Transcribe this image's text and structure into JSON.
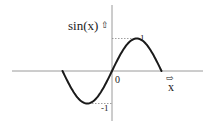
{
  "diagram": {
    "type": "function-plot",
    "function": "sin(x)",
    "labels": {
      "y_axis": "sin(x)",
      "x_axis": "x",
      "origin": "0",
      "max": "1",
      "min": "-1",
      "up_arrow": "⇧",
      "right_arrow": "⇨"
    },
    "colors": {
      "curve": "#1a1a1a",
      "axis": "#999999",
      "guide": "#888888",
      "background": "#ffffff"
    }
  },
  "chart_data": {
    "type": "line",
    "title": "",
    "xlabel": "x",
    "ylabel": "sin(x)",
    "x": [
      -3.1416,
      -2.3562,
      -1.5708,
      -0.7854,
      0,
      0.7854,
      1.5708,
      2.3562,
      3.1416
    ],
    "series": [
      {
        "name": "sin(x)",
        "values": [
          0,
          -0.707,
          -1,
          -0.707,
          0,
          0.707,
          1,
          0.707,
          0
        ]
      }
    ],
    "annotations": [
      "0",
      "1",
      "-1"
    ],
    "ylim": [
      -1,
      1
    ],
    "grid": false
  }
}
